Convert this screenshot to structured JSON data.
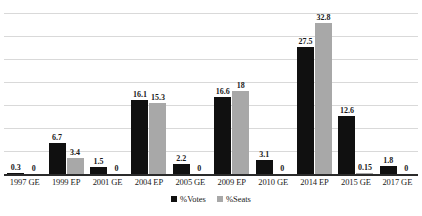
{
  "chart_data": {
    "type": "bar",
    "title": "",
    "subtitle": "",
    "xlabel": "",
    "ylabel": "",
    "ylim": [
      0,
      36
    ],
    "grid": true,
    "gridlines": [
      5,
      10,
      15,
      20,
      25,
      30,
      35
    ],
    "legend_position": "bottom-center",
    "categories": [
      "1997 GE",
      "1999 EP",
      "2001 GE",
      "2004 EP",
      "2005 GE",
      "2009 EP",
      "2010 GE",
      "2014 EP",
      "2015 GE",
      "2017 GE"
    ],
    "series": [
      {
        "name": "%Votes",
        "color": "#101010",
        "values": [
          0.3,
          6.7,
          1.5,
          16.1,
          2.2,
          16.6,
          3.1,
          27.5,
          12.6,
          1.8
        ],
        "labels": [
          "0.3",
          "6.7",
          "1.5",
          "16.1",
          "2.2",
          "16.6",
          "3.1",
          "27.5",
          "12.6",
          "1.8"
        ]
      },
      {
        "name": "%Seats",
        "color": "#a8a8a8",
        "values": [
          0,
          3.4,
          0,
          15.3,
          0,
          18,
          0,
          32.8,
          0.15,
          0
        ],
        "labels": [
          "0",
          "3.4",
          "0",
          "15.3",
          "0",
          "18",
          "0",
          "32.8",
          "0.15",
          "0"
        ]
      }
    ]
  },
  "legend": {
    "entries": [
      {
        "label": "%Votes",
        "color": "#101010"
      },
      {
        "label": "%Seats",
        "color": "#a8a8a8"
      }
    ]
  }
}
